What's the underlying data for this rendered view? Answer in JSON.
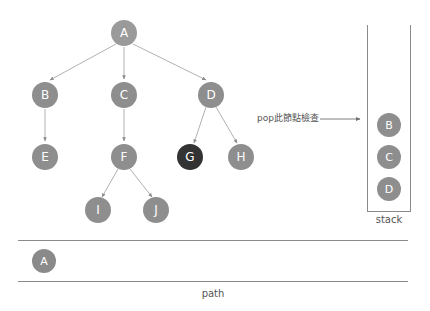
{
  "diagram": {
    "title_text": "",
    "colors": {
      "node_fill": "#8e8e8e",
      "current_node_fill": "#333333",
      "edge": "#a8a8a8",
      "border": "#8a8a8a",
      "label_text": "#555555",
      "node_text": "#ffffff",
      "background": "#ffffff"
    },
    "tree": {
      "nodes": [
        {
          "id": "A",
          "label": "A",
          "x": 124,
          "y": 33,
          "state": "root"
        },
        {
          "id": "B",
          "label": "B",
          "x": 45,
          "y": 95,
          "state": "normal"
        },
        {
          "id": "C",
          "label": "C",
          "x": 124,
          "y": 95,
          "state": "normal"
        },
        {
          "id": "D",
          "label": "D",
          "x": 211,
          "y": 95,
          "state": "normal"
        },
        {
          "id": "E",
          "label": "E",
          "x": 45,
          "y": 157,
          "state": "normal"
        },
        {
          "id": "F",
          "label": "F",
          "x": 124,
          "y": 157,
          "state": "normal"
        },
        {
          "id": "G",
          "label": "G",
          "x": 190,
          "y": 157,
          "state": "current"
        },
        {
          "id": "H",
          "label": "H",
          "x": 241,
          "y": 157,
          "state": "normal"
        },
        {
          "id": "I",
          "label": "I",
          "x": 98,
          "y": 210,
          "state": "normal"
        },
        {
          "id": "J",
          "label": "J",
          "x": 156,
          "y": 210,
          "state": "normal"
        }
      ],
      "edges": [
        {
          "from": "A",
          "to": "B"
        },
        {
          "from": "A",
          "to": "C"
        },
        {
          "from": "A",
          "to": "D"
        },
        {
          "from": "B",
          "to": "E"
        },
        {
          "from": "C",
          "to": "F"
        },
        {
          "from": "D",
          "to": "G"
        },
        {
          "from": "D",
          "to": "H"
        },
        {
          "from": "F",
          "to": "I"
        },
        {
          "from": "F",
          "to": "J"
        }
      ]
    },
    "annotation": {
      "text": "pop此節點檢查",
      "arrow": {
        "x1": 320,
        "y1": 119,
        "x2": 362,
        "y2": 119
      }
    },
    "stack": {
      "label": "stack",
      "items": [
        {
          "label": "B",
          "x": 389,
          "y": 125
        },
        {
          "label": "C",
          "x": 389,
          "y": 157
        },
        {
          "label": "D",
          "x": 389,
          "y": 189
        }
      ]
    },
    "path": {
      "label": "path",
      "items": [
        {
          "label": "A",
          "x": 44,
          "y": 261
        }
      ]
    }
  }
}
